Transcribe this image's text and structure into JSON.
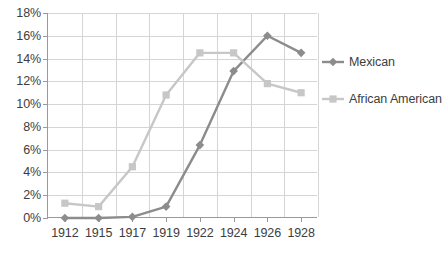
{
  "chart_data": {
    "type": "line",
    "title": "",
    "subtitle": "",
    "xlabel": "",
    "ylabel": "",
    "categories": [
      "1912",
      "1915",
      "1917",
      "1919",
      "1922",
      "1924",
      "1926",
      "1928"
    ],
    "ylim": [
      0,
      18
    ],
    "y_tick_step": 2,
    "y_ticks": [
      "0%",
      "2%",
      "4%",
      "6%",
      "8%",
      "10%",
      "12%",
      "14%",
      "16%",
      "18%"
    ],
    "y_tick_values": [
      0,
      2,
      4,
      6,
      8,
      10,
      12,
      14,
      16,
      18
    ],
    "y_axis_unit": "%",
    "grid": true,
    "grid_horizontal": true,
    "grid_vertical": true,
    "legend_position": "right",
    "series": [
      {
        "name": "Mexican",
        "color": "#8c8c8c",
        "marker": "diamond",
        "values": [
          0,
          0,
          0.1,
          1.0,
          6.4,
          12.9,
          16.0,
          14.5
        ]
      },
      {
        "name": "African American",
        "color": "#c7c7c7",
        "marker": "square",
        "values": [
          1.3,
          1.0,
          4.5,
          10.8,
          14.5,
          14.5,
          11.8,
          11.0
        ]
      }
    ],
    "annotations": []
  },
  "legend": {
    "items": [
      {
        "label": "Mexican",
        "color": "#8c8c8c",
        "marker": "diamond"
      },
      {
        "label": "African American",
        "color": "#c7c7c7",
        "marker": "square"
      }
    ]
  },
  "colors": {
    "background": "#ffffff",
    "axis": "#9a9a9a",
    "gridline": "#d5d5d5",
    "text": "#3d3d3d",
    "series_mexican": "#8c8c8c",
    "series_african_american": "#c7c7c7"
  }
}
